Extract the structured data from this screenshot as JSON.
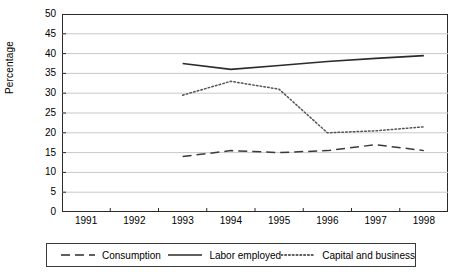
{
  "chart_data": {
    "type": "line",
    "title": "",
    "xlabel": "",
    "ylabel": "Percentage",
    "grid": true,
    "legend_position": "bottom",
    "xlim": [
      1991,
      1998
    ],
    "ylim": [
      0,
      50
    ],
    "ytick_step": 5,
    "categories": [
      "1991",
      "1992",
      "1993",
      "1994",
      "1995",
      "1996",
      "1997",
      "1998"
    ],
    "yticks": [
      "0",
      "5",
      "10",
      "15",
      "20",
      "25",
      "30",
      "35",
      "40",
      "45",
      "50"
    ],
    "x": [
      1993,
      1994,
      1995,
      1996,
      1997,
      1998
    ],
    "series": [
      {
        "name": "Consumption",
        "style": "dashed",
        "color": "#3a3a3a",
        "x": [
          1993,
          1994,
          1995,
          1996,
          1997,
          1998
        ],
        "values": [
          14.0,
          15.5,
          15.0,
          15.5,
          17.0,
          15.5
        ]
      },
      {
        "name": "Labor employed",
        "style": "solid",
        "color": "#2b2b2b",
        "x": [
          1993,
          1994,
          1995,
          1996,
          1997,
          1998
        ],
        "values": [
          37.5,
          36.0,
          37.0,
          38.0,
          38.8,
          39.5
        ]
      },
      {
        "name": "Capital and business",
        "style": "dotted",
        "color": "#555555",
        "x": [
          1993,
          1994,
          1995,
          1996,
          1997,
          1998
        ],
        "values": [
          29.5,
          33.0,
          31.0,
          20.0,
          20.5,
          21.5
        ]
      }
    ]
  },
  "axis": {
    "ylabel": "Percentage",
    "yticks": [
      "50",
      "45",
      "40",
      "35",
      "30",
      "25",
      "20",
      "15",
      "10",
      "5",
      "0"
    ],
    "xticks": [
      "1991",
      "1992",
      "1993",
      "1994",
      "1995",
      "1996",
      "1997",
      "1998"
    ]
  },
  "legend": {
    "items": [
      {
        "label": "Consumption",
        "style": "dashed"
      },
      {
        "label": "Labor employed",
        "style": "solid"
      },
      {
        "label": "Capital and business",
        "style": "dotted"
      }
    ]
  }
}
